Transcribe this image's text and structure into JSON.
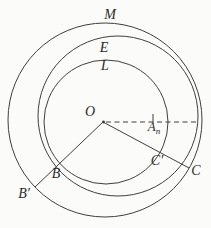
{
  "figure": {
    "background": "#fbfbfa",
    "stroke_color": "#3f3f3f",
    "text_color": "#2a2a2a",
    "labels": {
      "outer_circle": "M",
      "middle_circle": "E",
      "inner_circle": "L",
      "center": "O",
      "a_point_base": "A",
      "a_point_sub": "n",
      "c_prime": "C′",
      "c": "C",
      "b": "B",
      "b_prime": "B′"
    }
  }
}
